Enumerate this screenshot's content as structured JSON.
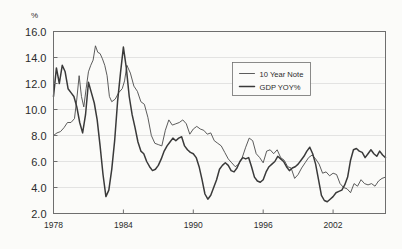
{
  "chart_data": {
    "type": "line",
    "title": "",
    "subtitle": "",
    "xlabel": "",
    "ylabel": "",
    "unit_label": "%",
    "grid": true,
    "legend_position": "top-right-inside",
    "xlim": [
      1978,
      2006.5
    ],
    "ylim": [
      2.0,
      16.0
    ],
    "yticks": [
      "16.0",
      "14.0",
      "12.0",
      "10.0",
      "8.0",
      "6.0",
      "4.0",
      "2.0"
    ],
    "ytick_values": [
      16.0,
      14.0,
      12.0,
      10.0,
      8.0,
      6.0,
      4.0,
      2.0
    ],
    "xticks": [
      "1978",
      "1984",
      "1990",
      "1996",
      "2002"
    ],
    "xtick_values": [
      1978,
      1984,
      1990,
      1996,
      2002
    ],
    "series": [
      {
        "name": "10 Year Note",
        "color": "#4a4a4a",
        "width": 0.9,
        "x": [
          1978.0,
          1978.3,
          1978.6,
          1978.9,
          1979.2,
          1979.5,
          1979.8,
          1980.0,
          1980.2,
          1980.4,
          1980.6,
          1980.8,
          1981.0,
          1981.2,
          1981.4,
          1981.6,
          1981.8,
          1982.0,
          1982.2,
          1982.4,
          1982.6,
          1982.8,
          1983.0,
          1983.3,
          1983.6,
          1983.9,
          1984.1,
          1984.3,
          1984.6,
          1984.9,
          1985.2,
          1985.5,
          1985.8,
          1986.1,
          1986.4,
          1986.7,
          1987.0,
          1987.3,
          1987.6,
          1987.9,
          1988.2,
          1988.5,
          1988.8,
          1989.1,
          1989.4,
          1989.7,
          1990.0,
          1990.3,
          1990.6,
          1990.9,
          1991.2,
          1991.5,
          1991.8,
          1992.1,
          1992.4,
          1992.7,
          1993.0,
          1993.3,
          1993.6,
          1993.9,
          1994.2,
          1994.5,
          1994.8,
          1995.1,
          1995.4,
          1995.7,
          1996.0,
          1996.3,
          1996.6,
          1996.9,
          1997.2,
          1997.5,
          1997.8,
          1998.1,
          1998.4,
          1998.7,
          1999.0,
          1999.3,
          1999.6,
          1999.9,
          2000.2,
          2000.5,
          2000.8,
          2001.1,
          2001.4,
          2001.7,
          2002.0,
          2002.3,
          2002.6,
          2002.9,
          2003.2,
          2003.5,
          2003.8,
          2004.1,
          2004.4,
          2004.7,
          2005.0,
          2005.3,
          2005.6,
          2005.9,
          2006.2,
          2006.5
        ],
        "y": [
          8.0,
          8.2,
          8.3,
          8.6,
          9.0,
          9.0,
          9.3,
          10.8,
          12.6,
          11.0,
          10.2,
          11.6,
          12.9,
          13.4,
          13.8,
          14.9,
          14.4,
          14.3,
          13.9,
          13.4,
          12.6,
          11.0,
          10.6,
          10.8,
          11.3,
          11.6,
          12.2,
          13.4,
          12.8,
          11.8,
          11.4,
          10.6,
          10.4,
          9.4,
          8.0,
          7.4,
          7.3,
          7.2,
          8.4,
          9.2,
          8.8,
          8.9,
          9.0,
          9.2,
          8.9,
          8.1,
          8.5,
          8.7,
          8.5,
          8.4,
          8.1,
          8.2,
          7.6,
          7.4,
          7.2,
          6.7,
          6.2,
          5.9,
          5.6,
          5.8,
          6.3,
          7.1,
          7.8,
          7.6,
          6.6,
          6.3,
          5.9,
          6.8,
          6.9,
          6.6,
          6.9,
          6.3,
          6.1,
          5.6,
          5.5,
          4.7,
          5.0,
          5.5,
          5.9,
          6.3,
          6.5,
          6.2,
          5.8,
          5.1,
          5.2,
          4.9,
          5.1,
          5.0,
          4.3,
          4.0,
          3.9,
          3.6,
          4.3,
          4.1,
          4.6,
          4.3,
          4.2,
          4.3,
          4.1,
          4.5,
          4.7,
          4.8
        ]
      },
      {
        "name": "GDP YOY%",
        "color": "#3a3a3a",
        "width": 1.5,
        "x": [
          1978.0,
          1978.25,
          1978.5,
          1978.75,
          1979.0,
          1979.25,
          1979.5,
          1979.75,
          1980.0,
          1980.25,
          1980.5,
          1980.75,
          1981.0,
          1981.25,
          1981.5,
          1981.75,
          1982.0,
          1982.25,
          1982.5,
          1982.75,
          1983.0,
          1983.25,
          1983.5,
          1983.75,
          1984.0,
          1984.25,
          1984.5,
          1984.75,
          1985.0,
          1985.25,
          1985.5,
          1985.75,
          1986.0,
          1986.25,
          1986.5,
          1986.75,
          1987.0,
          1987.25,
          1987.5,
          1987.75,
          1988.0,
          1988.25,
          1988.5,
          1988.75,
          1989.0,
          1989.25,
          1989.5,
          1989.75,
          1990.0,
          1990.25,
          1990.5,
          1990.75,
          1991.0,
          1991.25,
          1991.5,
          1991.75,
          1992.0,
          1992.25,
          1992.5,
          1992.75,
          1993.0,
          1993.25,
          1993.5,
          1993.75,
          1994.0,
          1994.25,
          1994.5,
          1994.75,
          1995.0,
          1995.25,
          1995.5,
          1995.75,
          1996.0,
          1996.25,
          1996.5,
          1996.75,
          1997.0,
          1997.25,
          1997.5,
          1997.75,
          1998.0,
          1998.25,
          1998.5,
          1998.75,
          1999.0,
          1999.25,
          1999.5,
          1999.75,
          2000.0,
          2000.25,
          2000.5,
          2000.75,
          2001.0,
          2001.25,
          2001.5,
          2001.75,
          2002.0,
          2002.25,
          2002.5,
          2002.75,
          2003.0,
          2003.25,
          2003.5,
          2003.75,
          2004.0,
          2004.25,
          2004.5,
          2004.75,
          2005.0,
          2005.25,
          2005.5,
          2005.75,
          2006.0,
          2006.25,
          2006.5
        ],
        "y": [
          11.0,
          13.2,
          12.0,
          13.4,
          12.9,
          11.6,
          11.3,
          11.0,
          10.2,
          9.0,
          8.2,
          9.6,
          12.1,
          11.3,
          10.5,
          9.2,
          7.2,
          5.0,
          3.3,
          3.8,
          5.4,
          7.6,
          10.6,
          12.8,
          14.8,
          13.2,
          11.0,
          9.6,
          8.6,
          7.5,
          6.8,
          6.6,
          6.0,
          5.6,
          5.3,
          5.4,
          5.7,
          6.2,
          6.8,
          7.2,
          7.5,
          7.8,
          7.6,
          7.8,
          7.9,
          7.2,
          6.9,
          6.7,
          6.6,
          6.3,
          5.6,
          4.6,
          3.5,
          3.1,
          3.4,
          4.0,
          4.6,
          5.4,
          5.7,
          5.9,
          5.7,
          5.3,
          5.2,
          5.5,
          6.0,
          6.3,
          6.2,
          6.3,
          5.6,
          4.8,
          4.5,
          4.4,
          4.6,
          5.2,
          5.6,
          5.8,
          6.0,
          6.4,
          6.2,
          6.0,
          5.6,
          5.3,
          5.5,
          5.6,
          5.8,
          6.1,
          6.4,
          6.8,
          7.1,
          6.6,
          5.8,
          4.6,
          3.4,
          3.0,
          2.9,
          3.1,
          3.3,
          3.6,
          3.7,
          3.8,
          4.2,
          4.8,
          6.1,
          6.9,
          7.0,
          6.8,
          6.7,
          6.3,
          6.6,
          6.9,
          6.6,
          6.4,
          6.8,
          6.5,
          6.3
        ]
      }
    ]
  },
  "legend": {
    "items": [
      {
        "label": "10 Year Note"
      },
      {
        "label": "GDP YOY%"
      }
    ]
  }
}
